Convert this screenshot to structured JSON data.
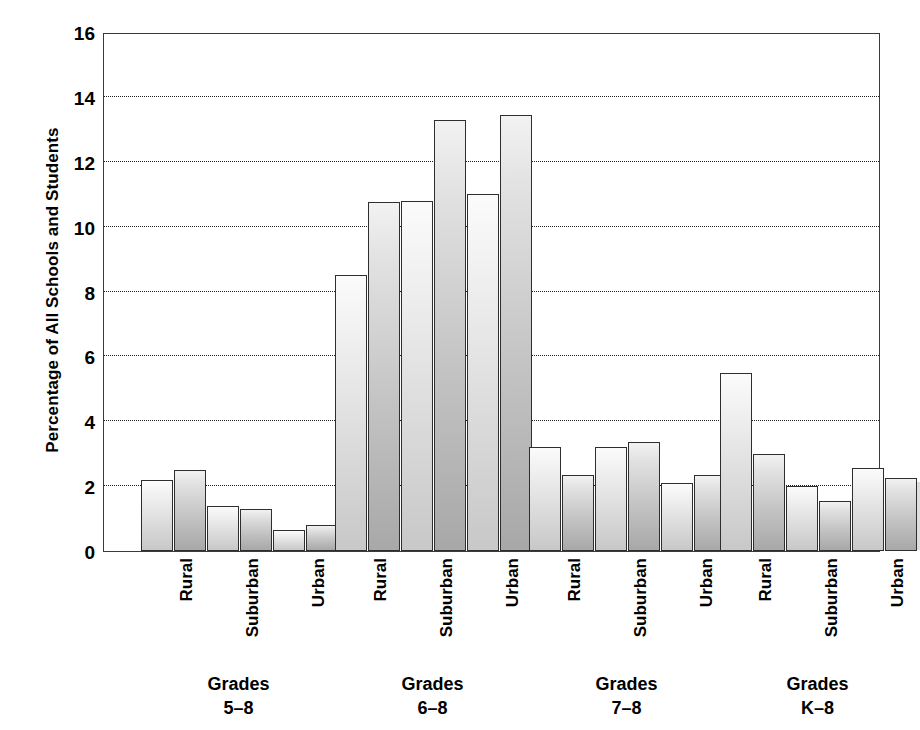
{
  "chart_data": {
    "type": "bar",
    "title": "",
    "xlabel": "",
    "ylabel": "Percentage of All Schools and Students",
    "ylim": [
      0,
      16
    ],
    "ytick_step": 2,
    "yticks": [
      "16",
      "14",
      "12",
      "10",
      "8",
      "6",
      "4",
      "2",
      "0"
    ],
    "grid": true,
    "legend_position": "none",
    "group_labels": [
      {
        "line1": "Grades",
        "line2": "5–8"
      },
      {
        "line1": "Grades",
        "line2": "6–8"
      },
      {
        "line1": "Grades",
        "line2": "7–8"
      },
      {
        "line1": "Grades",
        "line2": "K–8"
      }
    ],
    "categories": [
      "Rural",
      "Suburban",
      "Urban"
    ],
    "series": [
      {
        "name": "Schools",
        "shade": "light"
      },
      {
        "name": "Students",
        "shade": "dark"
      }
    ],
    "groups": [
      {
        "name": "Grades 5-8",
        "bars": [
          {
            "category": "Rural",
            "series": "Schools",
            "value": 2.2
          },
          {
            "category": "Rural",
            "series": "Students",
            "value": 2.5
          },
          {
            "category": "Suburban",
            "series": "Schools",
            "value": 1.4
          },
          {
            "category": "Suburban",
            "series": "Students",
            "value": 1.3
          },
          {
            "category": "Urban",
            "series": "Schools",
            "value": 0.65
          },
          {
            "category": "Urban",
            "series": "Students",
            "value": 0.8
          }
        ]
      },
      {
        "name": "Grades 6-8",
        "bars": [
          {
            "category": "Rural",
            "series": "Schools",
            "value": 8.5
          },
          {
            "category": "Rural",
            "series": "Students",
            "value": 10.75
          },
          {
            "category": "Suburban",
            "series": "Schools",
            "value": 10.8
          },
          {
            "category": "Suburban",
            "series": "Students",
            "value": 13.3
          },
          {
            "category": "Urban",
            "series": "Schools",
            "value": 11.0
          },
          {
            "category": "Urban",
            "series": "Students",
            "value": 13.45
          }
        ]
      },
      {
        "name": "Grades 7-8",
        "bars": [
          {
            "category": "Rural",
            "series": "Schools",
            "value": 3.2
          },
          {
            "category": "Rural",
            "series": "Students",
            "value": 2.35
          },
          {
            "category": "Suburban",
            "series": "Schools",
            "value": 3.2
          },
          {
            "category": "Suburban",
            "series": "Students",
            "value": 3.35
          },
          {
            "category": "Urban",
            "series": "Schools",
            "value": 2.1
          },
          {
            "category": "Urban",
            "series": "Students",
            "value": 2.35
          }
        ]
      },
      {
        "name": "Grades K-8",
        "bars": [
          {
            "category": "Rural",
            "series": "Schools",
            "value": 5.5
          },
          {
            "category": "Rural",
            "series": "Students",
            "value": 3.0
          },
          {
            "category": "Suburban",
            "series": "Schools",
            "value": 2.0
          },
          {
            "category": "Suburban",
            "series": "Students",
            "value": 1.55
          },
          {
            "category": "Urban",
            "series": "Schools",
            "value": 2.55
          },
          {
            "category": "Urban",
            "series": "Students",
            "value": 2.25
          }
        ]
      }
    ],
    "colors": {
      "bar_light": "#e6e6e6",
      "bar_dark": "#c6c6c6",
      "bar_outline": "#2e2e2e",
      "gridline": "#1a1a1a",
      "axis": "#3b3b3b",
      "text": "#000000",
      "background": "#ffffff"
    }
  },
  "layout": {
    "plot": {
      "left": 103,
      "top": 33,
      "width": 777,
      "height": 519
    },
    "group_x": [
      {
        "start": 37,
        "bars": [
          0,
          33,
          66,
          99,
          132,
          165
        ],
        "bar_width": 32
      },
      {
        "start": 231,
        "bars": [
          0,
          33,
          66,
          99,
          132,
          165
        ],
        "bar_width": 32
      },
      {
        "start": 425,
        "bars": [
          0,
          33,
          66,
          99,
          132,
          165
        ],
        "bar_width": 32
      },
      {
        "start": 616,
        "bars": [
          0,
          33,
          66,
          99,
          132,
          165
        ],
        "bar_width": 32
      }
    ]
  }
}
